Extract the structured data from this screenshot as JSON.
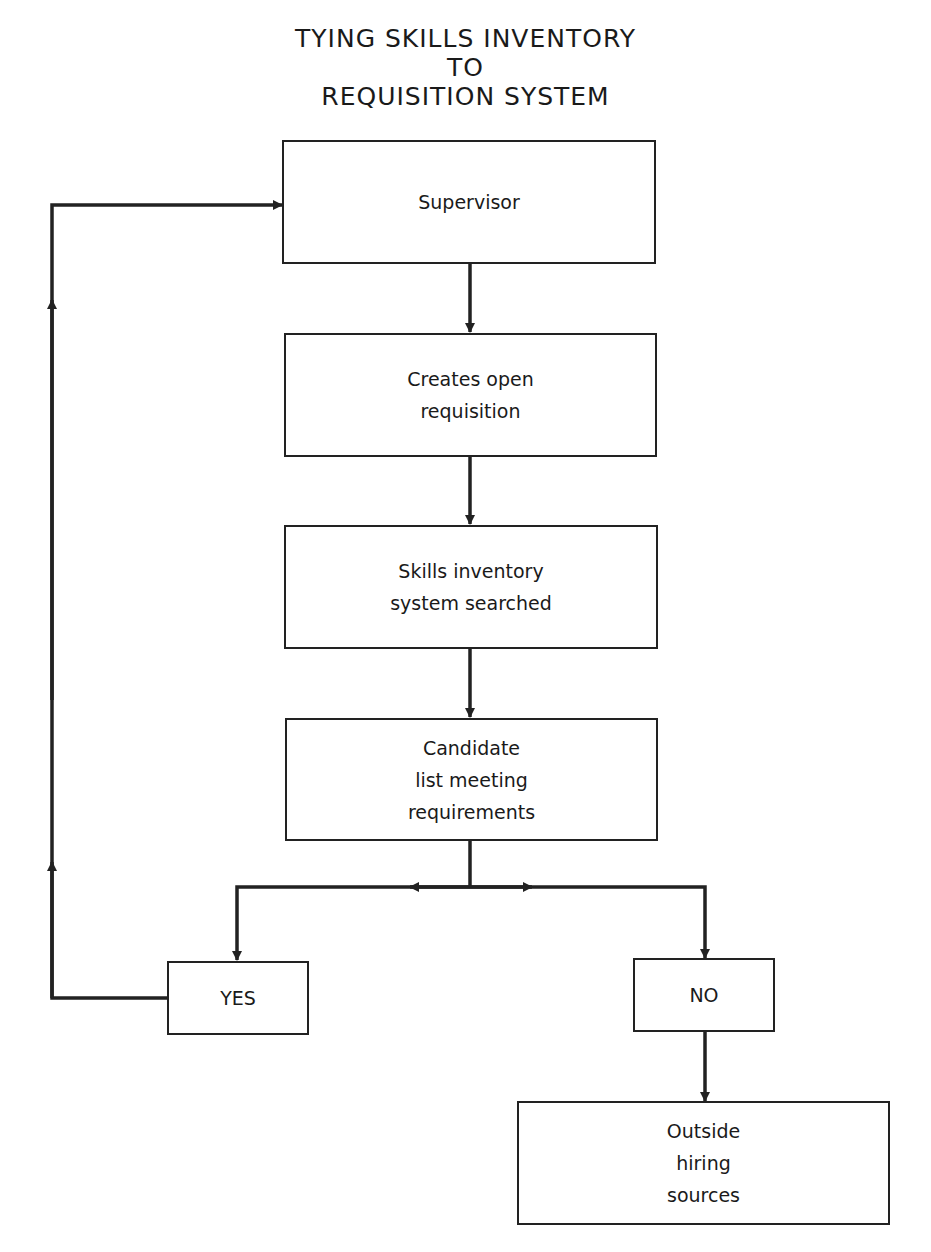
{
  "diagram": {
    "title_lines": [
      "TYING SKILLS INVENTORY",
      "TO",
      "REQUISITION SYSTEM"
    ],
    "nodes": {
      "supervisor": "Supervisor",
      "creates_requisition": "Creates open\nrequisition",
      "skills_search": "Skills inventory\nsystem searched",
      "candidate_list": "Candidate\nlist meeting\nrequirements",
      "yes": "YES",
      "no": "NO",
      "outside_hiring": "Outside\nhiring\nsources"
    },
    "edges": [
      {
        "from": "supervisor",
        "to": "creates_requisition"
      },
      {
        "from": "creates_requisition",
        "to": "skills_search"
      },
      {
        "from": "skills_search",
        "to": "candidate_list"
      },
      {
        "from": "candidate_list",
        "to": "yes"
      },
      {
        "from": "candidate_list",
        "to": "no"
      },
      {
        "from": "yes",
        "to": "supervisor",
        "label": "loop back"
      },
      {
        "from": "no",
        "to": "outside_hiring"
      }
    ],
    "line_color": "#222222"
  }
}
